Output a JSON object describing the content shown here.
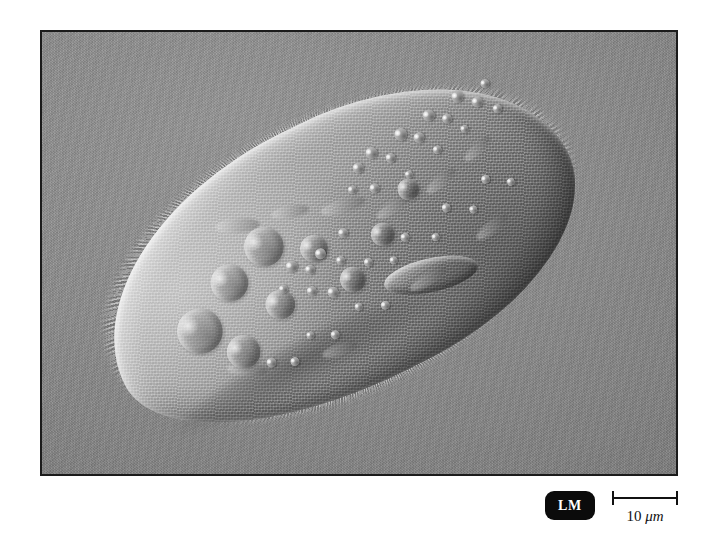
{
  "figure": {
    "kind": "light-micrograph",
    "technique": "differential interference contrast",
    "orientation": "anterior end upper-right, posterior end lower-left",
    "background_color": "#888888",
    "border_color": "#1b1b1b",
    "plate": {
      "x": 40,
      "y": 30,
      "width": 638,
      "height": 446
    }
  },
  "labels": {
    "lm_badge": "LM",
    "lm_badge_bg": "#0b0b0b",
    "lm_badge_fg": "#ffffff"
  },
  "scale_bar": {
    "value": "10",
    "unit": "μm",
    "full_text": "10 μm",
    "bar_pixel_length": 66,
    "color": "#111111"
  },
  "cell": {
    "body_highlight": "#d2d2d2",
    "body_midtone": "#9d9d9d",
    "body_shadow": "#6f6f6f",
    "rotation_deg": -26.5,
    "features": [
      {
        "name": "cilia-fringe",
        "note": "fine hair-like projections around entire pellicle"
      },
      {
        "name": "oral-groove",
        "note": "curved depression on ventral margin, mid-body"
      },
      {
        "name": "food-vacuoles",
        "count": 9,
        "note": "large circular vacuoles clustered in posterior half"
      },
      {
        "name": "cytoplasmic-granules",
        "count": 38,
        "note": "small bright spheres, chain along dorsal anterior"
      }
    ],
    "vacuoles": [
      {
        "left": 68,
        "top": 118,
        "size": 46
      },
      {
        "left": 120,
        "top": 92,
        "size": 38
      },
      {
        "left": 104,
        "top": 162,
        "size": 34
      },
      {
        "left": 160,
        "top": 138,
        "size": 30
      },
      {
        "left": 166,
        "top": 74,
        "size": 40
      },
      {
        "left": 216,
        "top": 104,
        "size": 28
      },
      {
        "left": 238,
        "top": 150,
        "size": 26
      },
      {
        "left": 286,
        "top": 124,
        "size": 24
      },
      {
        "left": 330,
        "top": 96,
        "size": 22
      }
    ],
    "granules": [
      {
        "left": 300,
        "top": 60,
        "size": 11
      },
      {
        "left": 318,
        "top": 52,
        "size": 12
      },
      {
        "left": 334,
        "top": 66,
        "size": 10
      },
      {
        "left": 352,
        "top": 48,
        "size": 13
      },
      {
        "left": 368,
        "top": 60,
        "size": 11
      },
      {
        "left": 386,
        "top": 44,
        "size": 12
      },
      {
        "left": 402,
        "top": 56,
        "size": 10
      },
      {
        "left": 420,
        "top": 40,
        "size": 12
      },
      {
        "left": 436,
        "top": 54,
        "size": 11
      },
      {
        "left": 452,
        "top": 42,
        "size": 9
      },
      {
        "left": 286,
        "top": 78,
        "size": 9
      },
      {
        "left": 306,
        "top": 86,
        "size": 10
      },
      {
        "left": 344,
        "top": 90,
        "size": 8
      },
      {
        "left": 380,
        "top": 80,
        "size": 9
      },
      {
        "left": 414,
        "top": 74,
        "size": 8
      },
      {
        "left": 452,
        "top": 70,
        "size": 9
      },
      {
        "left": 196,
        "top": 118,
        "size": 12
      },
      {
        "left": 212,
        "top": 130,
        "size": 10
      },
      {
        "left": 228,
        "top": 120,
        "size": 11
      },
      {
        "left": 244,
        "top": 136,
        "size": 9
      },
      {
        "left": 204,
        "top": 150,
        "size": 10
      },
      {
        "left": 222,
        "top": 160,
        "size": 11
      },
      {
        "left": 180,
        "top": 136,
        "size": 9
      },
      {
        "left": 258,
        "top": 112,
        "size": 10
      },
      {
        "left": 268,
        "top": 150,
        "size": 9
      },
      {
        "left": 292,
        "top": 160,
        "size": 8
      },
      {
        "left": 312,
        "top": 144,
        "size": 9
      },
      {
        "left": 340,
        "top": 158,
        "size": 8
      },
      {
        "left": 362,
        "top": 136,
        "size": 9
      },
      {
        "left": 386,
        "top": 150,
        "size": 8
      },
      {
        "left": 410,
        "top": 128,
        "size": 9
      },
      {
        "left": 432,
        "top": 142,
        "size": 8
      },
      {
        "left": 136,
        "top": 196,
        "size": 10
      },
      {
        "left": 158,
        "top": 206,
        "size": 9
      },
      {
        "left": 184,
        "top": 190,
        "size": 8
      },
      {
        "left": 206,
        "top": 200,
        "size": 9
      },
      {
        "left": 240,
        "top": 186,
        "size": 8
      },
      {
        "left": 264,
        "top": 196,
        "size": 9
      }
    ],
    "streaks": [
      {
        "left": 150,
        "top": 56,
        "w": 44,
        "h": 15,
        "rot": 22
      },
      {
        "left": 206,
        "top": 68,
        "w": 38,
        "h": 13,
        "rot": 16
      },
      {
        "left": 252,
        "top": 86,
        "w": 46,
        "h": 14,
        "rot": 10
      },
      {
        "left": 300,
        "top": 110,
        "w": 40,
        "h": 12,
        "rot": -8
      },
      {
        "left": 356,
        "top": 108,
        "w": 36,
        "h": 12,
        "rot": -14
      },
      {
        "left": 404,
        "top": 96,
        "w": 34,
        "h": 11,
        "rot": -18
      },
      {
        "left": 96,
        "top": 190,
        "w": 40,
        "h": 13,
        "rot": 30
      },
      {
        "left": 190,
        "top": 214,
        "w": 36,
        "h": 12,
        "rot": 8
      },
      {
        "left": 298,
        "top": 190,
        "w": 42,
        "h": 12,
        "rot": -5
      },
      {
        "left": 380,
        "top": 172,
        "w": 38,
        "h": 12,
        "rot": -12
      }
    ]
  }
}
